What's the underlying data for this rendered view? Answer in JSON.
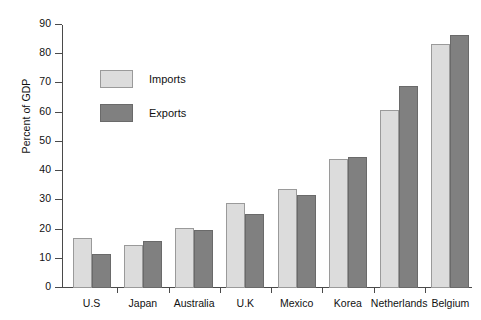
{
  "chart_data": {
    "type": "bar",
    "title": "",
    "xlabel": "",
    "ylabel": "Percent of GDP",
    "ylim": [
      0,
      90
    ],
    "yticks": [
      0,
      10,
      20,
      30,
      40,
      50,
      60,
      70,
      80,
      90
    ],
    "grid": false,
    "legend_position": "upper-left-inside",
    "categories": [
      "U.S",
      "Japan",
      "Australia",
      "U.K",
      "Mexico",
      "Korea",
      "Netherlands",
      "Belgium"
    ],
    "series": [
      {
        "name": "Imports",
        "color": "#dcdcdc",
        "values": [
          17,
          14.8,
          20.5,
          29,
          34,
          44.3,
          61,
          83.5
        ]
      },
      {
        "name": "Exports",
        "color": "#808080",
        "values": [
          11.6,
          16,
          19.7,
          25.3,
          32,
          45,
          69,
          86.5
        ]
      }
    ]
  },
  "legend": {
    "items": [
      {
        "label": "Imports"
      },
      {
        "label": "Exports"
      }
    ]
  },
  "axis": {
    "y_label": "Percent of GDP"
  }
}
